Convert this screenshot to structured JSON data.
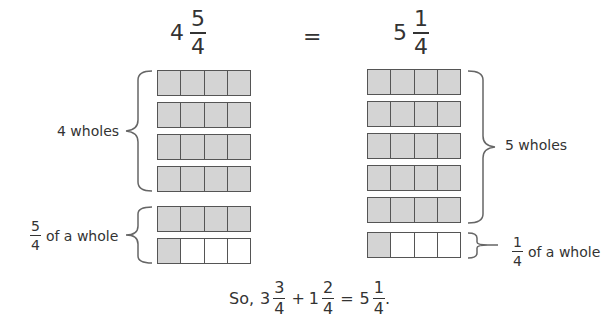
{
  "equation_top": {
    "left": {
      "whole": "4",
      "numerator": "5",
      "denominator": "4"
    },
    "equals": "=",
    "right": {
      "whole": "5",
      "numerator": "1",
      "denominator": "4"
    }
  },
  "left_model": {
    "whole_strips": 4,
    "whole_label": "4 wholes",
    "fraction_label": {
      "numerator": "5",
      "denominator": "4",
      "text": "of a whole"
    },
    "strips": [
      [
        1,
        1,
        1,
        1
      ],
      [
        1,
        1,
        1,
        1
      ],
      [
        1,
        1,
        1,
        1
      ],
      [
        1,
        1,
        1,
        1
      ],
      [
        1,
        1,
        1,
        1
      ],
      [
        1,
        0,
        0,
        0
      ]
    ]
  },
  "right_model": {
    "whole_label": "5 wholes",
    "fraction_label": {
      "numerator": "1",
      "denominator": "4",
      "text": "of a whole"
    },
    "strips": [
      [
        1,
        1,
        1,
        1
      ],
      [
        1,
        1,
        1,
        1
      ],
      [
        1,
        1,
        1,
        1
      ],
      [
        1,
        1,
        1,
        1
      ],
      [
        1,
        1,
        1,
        1
      ],
      [
        1,
        0,
        0,
        0
      ]
    ]
  },
  "conclusion": {
    "prefix": "So,",
    "term1": {
      "whole": "3",
      "numerator": "3",
      "denominator": "4"
    },
    "plus": "+",
    "term2": {
      "whole": "1",
      "numerator": "2",
      "denominator": "4"
    },
    "equals": "=",
    "result": {
      "whole": "5",
      "numerator": "1",
      "denominator": "4"
    },
    "end": "."
  },
  "colors": {
    "filled": "#d4d4d4",
    "empty": "#ffffff",
    "border": "#555555"
  }
}
